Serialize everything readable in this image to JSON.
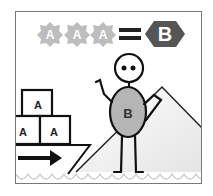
{
  "equation": {
    "left_symbols": [
      "A",
      "A",
      "A"
    ],
    "operator": "=",
    "right_symbol": "B"
  },
  "character": {
    "body_label": "B"
  },
  "boxes": [
    "A",
    "A",
    "A"
  ],
  "colors": {
    "badge_gray": "#bdbdbd",
    "hexagon_dark": "#555555",
    "body_fill": "#b5b5b5",
    "line": "#111111",
    "wave": "#c8c8c8",
    "frame": "#777777"
  }
}
